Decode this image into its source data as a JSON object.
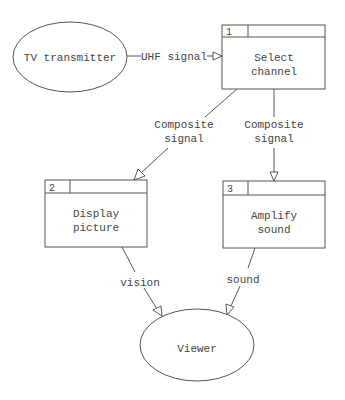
{
  "diagram": {
    "type": "data-flow-diagram",
    "colors": {
      "line": "#555555",
      "text": "#444444",
      "background": "#ffffff"
    },
    "externals": [
      {
        "id": "tv-transmitter",
        "label": "TV transmitter"
      },
      {
        "id": "viewer",
        "label": "Viewer"
      }
    ],
    "processes": [
      {
        "id": "p1",
        "number": "1",
        "label_line1": "Select",
        "label_line2": "channel"
      },
      {
        "id": "p2",
        "number": "2",
        "label_line1": "Display",
        "label_line2": "picture"
      },
      {
        "id": "p3",
        "number": "3",
        "label_line1": "Amplify",
        "label_line2": "sound"
      }
    ],
    "flows": [
      {
        "from": "tv-transmitter",
        "to": "p1",
        "label_line1": "UHF signal",
        "label_line2": ""
      },
      {
        "from": "p1",
        "to": "p2",
        "label_line1": "Composite",
        "label_line2": "signal"
      },
      {
        "from": "p1",
        "to": "p3",
        "label_line1": "Composite",
        "label_line2": "signal"
      },
      {
        "from": "p2",
        "to": "viewer",
        "label_line1": "vision",
        "label_line2": ""
      },
      {
        "from": "p3",
        "to": "viewer",
        "label_line1": "sound",
        "label_line2": ""
      }
    ]
  }
}
